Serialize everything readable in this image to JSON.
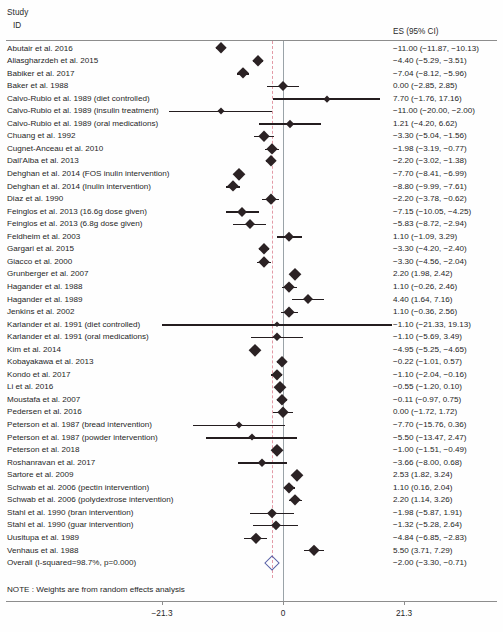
{
  "header": {
    "study_line1": "Study",
    "study_line2": "ID",
    "es_header": "ES  (95% CI)"
  },
  "note": "NOTE : Weights are from random effects analysis",
  "axis": {
    "ticks": [
      {
        "value": -21.3,
        "label": "−21.3"
      },
      {
        "value": 0,
        "label": "0"
      },
      {
        "value": 21.3,
        "label": "21.3"
      }
    ],
    "zero_line_value": 0,
    "overall_line_value": -2.0
  },
  "colors": {
    "marker": "#2b2224",
    "overall_diamond": "#5b63a8",
    "overall_dashed_line": "#e39aa6",
    "zero_line": "#9aa3a8",
    "rule": "#8d8d8d",
    "text": "#1f1f1f"
  },
  "chart_data": {
    "type": "forest",
    "title": "",
    "xlabel": "",
    "ylabel": "",
    "xlim": [
      -21.3,
      21.3
    ],
    "grid": false,
    "legend": "none",
    "effect_measure": "ES  (95% CI)",
    "overall_effect": -2.0,
    "heterogeneity": "I-squared=98.7%, p=0.000",
    "rows": [
      {
        "study": "Abutair et al. 2016",
        "sub": "",
        "es": -11.0,
        "lo": -11.87,
        "hi": -10.13,
        "es_text": "−11.00 (−11.87, −10.13)",
        "weight": 5.2
      },
      {
        "study": "Aliasgharzdeh et al. 2015",
        "sub": "",
        "es": -4.4,
        "lo": -5.29,
        "hi": -3.51,
        "es_text": "−4.40 (−5.29, −3.51)",
        "weight": 5.2
      },
      {
        "study": "Babiker et al. 2017",
        "sub": "",
        "es": -7.04,
        "lo": -8.12,
        "hi": -5.96,
        "es_text": "−7.04 (−8.12, −5.96)",
        "weight": 5.0
      },
      {
        "study": "Baker et al. 1988",
        "sub": "",
        "es": 0.0,
        "lo": -2.85,
        "hi": 2.85,
        "es_text": "0.00 (−2.85, 2.85)",
        "weight": 3.9
      },
      {
        "study": "Calvo-Rubio et al. 1989",
        "sub": "(diet controlled)",
        "es": 7.7,
        "lo": -1.76,
        "hi": 17.16,
        "es_text": "7.70 (−1.76, 17.16)",
        "weight": 1.6
      },
      {
        "study": "Calvo-Rubio et al. 1989",
        "sub": "(insulin treatment)",
        "es": -11.0,
        "lo": -20.0,
        "hi": -2.0,
        "es_text": "−11.00 (−20.00, −2.00)",
        "weight": 1.7
      },
      {
        "study": "Calvo-Rubio et al. 1989",
        "sub": "(oral medications)",
        "es": 1.21,
        "lo": -4.2,
        "hi": 6.62,
        "es_text": "1.21 (−4.20, 6.62)",
        "weight": 2.7
      },
      {
        "study": "Chuang et al. 1992",
        "sub": "",
        "es": -3.3,
        "lo": -5.04,
        "hi": -1.56,
        "es_text": "−3.30 (−5.04, −1.56)",
        "weight": 4.5
      },
      {
        "study": "Cugnet-Anceau et al. 2010",
        "sub": "",
        "es": -1.98,
        "lo": -3.19,
        "hi": -0.77,
        "es_text": "−1.98 (−3.19, −0.77)",
        "weight": 4.9
      },
      {
        "study": "Dall'Alba et al. 2013",
        "sub": "",
        "es": -2.2,
        "lo": -3.02,
        "hi": -1.38,
        "es_text": "−2.20 (−3.02, −1.38)",
        "weight": 5.2
      },
      {
        "study": "Dehghan et al. 2014",
        "sub": "(FOS inulin intervention)",
        "es": -7.7,
        "lo": -8.41,
        "hi": -6.99,
        "es_text": "−7.70 (−8.41, −6.99)",
        "weight": 5.3
      },
      {
        "study": "Dehghan et al. 2014",
        "sub": "(Inulin intervention)",
        "es": -8.8,
        "lo": -9.99,
        "hi": -7.61,
        "es_text": "−8.80 (−9.99, −7.61)",
        "weight": 4.9
      },
      {
        "study": "Diaz et al. 1990",
        "sub": "",
        "es": -2.2,
        "lo": -3.78,
        "hi": -0.62,
        "es_text": "−2.20 (−3.78, −0.62)",
        "weight": 4.6
      },
      {
        "study": "Feinglos et al. 2013",
        "sub": "(16.6g dose given)",
        "es": -7.15,
        "lo": -10.05,
        "hi": -4.25,
        "es_text": "−7.15 (−10.05, −4.25)",
        "weight": 3.8
      },
      {
        "study": "Feinglos et al. 2013",
        "sub": "(6.8g dose given)",
        "es": -5.83,
        "lo": -8.72,
        "hi": -2.94,
        "es_text": "−5.83 (−8.72, −2.94)",
        "weight": 3.8
      },
      {
        "study": "Feldheim et al. 2003",
        "sub": "",
        "es": 1.1,
        "lo": -1.09,
        "hi": 3.29,
        "es_text": "1.10 (−1.09, 3.29)",
        "weight": 4.2
      },
      {
        "study": "Gargari et al. 2015",
        "sub": "",
        "es": -3.3,
        "lo": -4.2,
        "hi": -2.4,
        "es_text": "−3.30 (−4.20, −2.40)",
        "weight": 5.2
      },
      {
        "study": "Giacco et al. 2000",
        "sub": "",
        "es": -3.3,
        "lo": -4.56,
        "hi": -2.04,
        "es_text": "−3.30 (−4.56, −2.04)",
        "weight": 4.8
      },
      {
        "study": "Grunberger et al. 2007",
        "sub": "",
        "es": 2.2,
        "lo": 1.98,
        "hi": 2.42,
        "es_text": "2.20 (1.98, 2.42)",
        "weight": 5.4
      },
      {
        "study": "Hagander et al. 1988",
        "sub": "",
        "es": 1.1,
        "lo": -0.26,
        "hi": 2.46,
        "es_text": "1.10 (−0.26, 2.46)",
        "weight": 4.7
      },
      {
        "study": "Hagander et al. 1989",
        "sub": "",
        "es": 4.4,
        "lo": 1.64,
        "hi": 7.16,
        "es_text": "4.40 (1.64, 7.16)",
        "weight": 3.9
      },
      {
        "study": "Jenkins et al. 2002",
        "sub": "",
        "es": 1.1,
        "lo": -0.36,
        "hi": 2.56,
        "es_text": "1.10 (−0.36, 2.56)",
        "weight": 4.6
      },
      {
        "study": "Karlander et al. 1991",
        "sub": "(diet controlled)",
        "es": -1.1,
        "lo": -21.33,
        "hi": 19.13,
        "es_text": "−1.10 (−21.33, 19.13)",
        "weight": 0.4
      },
      {
        "study": "Karlander et al. 1991",
        "sub": "(oral medications)",
        "es": -1.1,
        "lo": -5.69,
        "hi": 3.49,
        "es_text": "−1.10 (−5.69, 3.49)",
        "weight": 3.0
      },
      {
        "study": "Kim et al. 2014",
        "sub": "",
        "es": -4.95,
        "lo": -5.25,
        "hi": -4.65,
        "es_text": "−4.95 (−5.25, −4.65)",
        "weight": 5.4
      },
      {
        "study": "Kobayakawa et al. 2013",
        "sub": "",
        "es": -0.22,
        "lo": -1.01,
        "hi": 0.57,
        "es_text": "−0.22 (−1.01, 0.57)",
        "weight": 5.2
      },
      {
        "study": "Kondo et al. 2017",
        "sub": "",
        "es": -1.1,
        "lo": -2.04,
        "hi": -0.16,
        "es_text": "−1.10 (−2.04, −0.16)",
        "weight": 5.1
      },
      {
        "study": "Li et al. 2016",
        "sub": "",
        "es": -0.55,
        "lo": -1.2,
        "hi": 0.1,
        "es_text": "−0.55 (−1.20, 0.10)",
        "weight": 5.3
      },
      {
        "study": "Moustafa et al. 2007",
        "sub": "",
        "es": -0.11,
        "lo": -0.97,
        "hi": 0.75,
        "es_text": "−0.11 (−0.97, 0.75)",
        "weight": 5.2
      },
      {
        "study": "Pedersen et al. 2016",
        "sub": "",
        "es": 0.0,
        "lo": -1.72,
        "hi": 1.72,
        "es_text": "0.00 (−1.72, 1.72)",
        "weight": 4.5
      },
      {
        "study": "Peterson et al. 1987",
        "sub": "(bread intervention)",
        "es": -7.7,
        "lo": -15.76,
        "hi": 0.36,
        "es_text": "−7.70 (−15.76, 0.36)",
        "weight": 1.9
      },
      {
        "study": "Peterson et al. 1987",
        "sub": "(powder intervention)",
        "es": -5.5,
        "lo": -13.47,
        "hi": 2.47,
        "es_text": "−5.50 (−13.47, 2.47)",
        "weight": 1.9
      },
      {
        "study": "Peterson et al. 2018",
        "sub": "",
        "es": -1.0,
        "lo": -1.51,
        "hi": -0.49,
        "es_text": "−1.00 (−1.51, −0.49)",
        "weight": 5.3
      },
      {
        "study": "Roshanravan et al. 2017",
        "sub": "",
        "es": -3.66,
        "lo": -8.0,
        "hi": 0.68,
        "es_text": "−3.66 (−8.00, 0.68)",
        "weight": 3.1
      },
      {
        "study": "Sartore et al. 2009",
        "sub": "",
        "es": 2.53,
        "lo": 1.82,
        "hi": 3.24,
        "es_text": "2.53 (1.82, 3.24)",
        "weight": 5.3
      },
      {
        "study": "Schwab et al. 2006",
        "sub": "(pectin intervention)",
        "es": 1.1,
        "lo": 0.16,
        "hi": 2.04,
        "es_text": "1.10 (0.16, 2.04)",
        "weight": 5.1
      },
      {
        "study": "Schwab et al. 2006",
        "sub": "(polydextrose intervention)",
        "es": 2.2,
        "lo": 1.14,
        "hi": 3.26,
        "es_text": "2.20 (1.14, 3.26)",
        "weight": 5.0
      },
      {
        "study": "Stahl et al. 1990",
        "sub": "(bran intervention)",
        "es": -1.98,
        "lo": -5.87,
        "hi": 1.91,
        "es_text": "−1.98 (−5.87, 1.91)",
        "weight": 3.3
      },
      {
        "study": "Stahl et al. 1990",
        "sub": "(guar intervention)",
        "es": -1.32,
        "lo": -5.28,
        "hi": 2.64,
        "es_text": "−1.32 (−5.28, 2.64)",
        "weight": 3.3
      },
      {
        "study": "Uusitupa et al. 1989",
        "sub": "",
        "es": -4.84,
        "lo": -6.85,
        "hi": -2.83,
        "es_text": "−4.84 (−6.85, −2.83)",
        "weight": 4.3
      },
      {
        "study": "Venhaus et al. 1988",
        "sub": "",
        "es": 5.5,
        "lo": 3.71,
        "hi": 7.29,
        "es_text": "5.50 (3.71, 7.29)",
        "weight": 4.4
      },
      {
        "study": "Overall",
        "sub": "(I-squared=98.7%, p=0.000)",
        "es": -2.0,
        "lo": -3.3,
        "hi": -0.71,
        "es_text": "−2.00 (−3.30, −0.71)",
        "weight": 100,
        "overall": true
      }
    ]
  }
}
